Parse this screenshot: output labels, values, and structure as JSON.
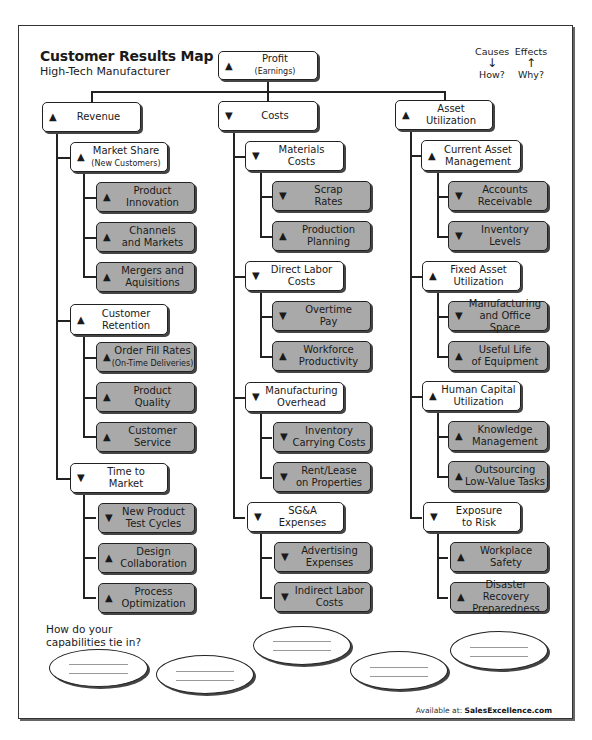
{
  "header": {
    "title": "Customer Results Map",
    "subtitle": "High-Tech Manufacturer"
  },
  "legend": {
    "causes": {
      "label": "Causes",
      "arrow": "↓",
      "question": "How?"
    },
    "effects": {
      "label": "Effects",
      "arrow": "↑",
      "question": "Why?"
    }
  },
  "symbols": {
    "up": "▲",
    "down": "▼"
  },
  "root": {
    "label": "Profit",
    "sublabel": "(Earnings)",
    "direction": "▲"
  },
  "columns": [
    {
      "label": "Revenue",
      "direction": "▲",
      "groups": [
        {
          "label": "Market Share",
          "sublabel": "(New Customers)",
          "direction": "▲",
          "items": [
            {
              "label": "Product",
              "label2": "Innovation",
              "direction": "▲"
            },
            {
              "label": "Channels",
              "label2": "and Markets",
              "direction": "▲"
            },
            {
              "label": "Mergers and",
              "label2": "Aquisitions",
              "direction": "▲"
            }
          ]
        },
        {
          "label": "Customer",
          "sublabel": "Retention",
          "direction": "▲",
          "items": [
            {
              "label": "Order Fill Rates",
              "label2": "(On-Time Deliveries)",
              "direction": "▲"
            },
            {
              "label": "Product",
              "label2": "Quality",
              "direction": "▲"
            },
            {
              "label": "Customer",
              "label2": "Service",
              "direction": "▲"
            }
          ]
        },
        {
          "label": "Time to",
          "sublabel": "Market",
          "direction": "▼",
          "items": [
            {
              "label": "New Product",
              "label2": "Test Cycles",
              "direction": "▼"
            },
            {
              "label": "Design",
              "label2": "Collaboration",
              "direction": "▲"
            },
            {
              "label": "Process",
              "label2": "Optimization",
              "direction": "▲"
            }
          ]
        }
      ]
    },
    {
      "label": "Costs",
      "direction": "▼",
      "groups": [
        {
          "label": "Materials",
          "sublabel": "Costs",
          "direction": "▼",
          "items": [
            {
              "label": "Scrap",
              "label2": "Rates",
              "direction": "▼"
            },
            {
              "label": "Production",
              "label2": "Planning",
              "direction": "▲"
            }
          ]
        },
        {
          "label": "Direct Labor",
          "sublabel": "Costs",
          "direction": "▼",
          "items": [
            {
              "label": "Overtime",
              "label2": "Pay",
              "direction": "▼"
            },
            {
              "label": "Workforce",
              "label2": "Productivity",
              "direction": "▲"
            }
          ]
        },
        {
          "label": "Manufacturing",
          "sublabel": "Overhead",
          "direction": "▼",
          "items": [
            {
              "label": "Inventory",
              "label2": "Carrying Costs",
              "direction": "▼"
            },
            {
              "label": "Rent/Lease",
              "label2": "on Properties",
              "direction": "▼"
            }
          ]
        },
        {
          "label": "SG&A",
          "sublabel": "Expenses",
          "direction": "▼",
          "items": [
            {
              "label": "Advertising",
              "label2": "Expenses",
              "direction": "▼"
            },
            {
              "label": "Indirect Labor",
              "label2": "Costs",
              "direction": "▼"
            }
          ]
        }
      ]
    },
    {
      "label": "Asset",
      "label2": "Utilization",
      "direction": "▲",
      "groups": [
        {
          "label": "Current Asset",
          "sublabel": "Management",
          "direction": "▲",
          "items": [
            {
              "label": "Accounts",
              "label2": "Receivable",
              "direction": "▼"
            },
            {
              "label": "Inventory",
              "label2": "Levels",
              "direction": "▼"
            }
          ]
        },
        {
          "label": "Fixed Asset",
          "sublabel": "Utilization",
          "direction": "▲",
          "items": [
            {
              "label": "Manufacturing",
              "label2": "and Office Space",
              "direction": "▼"
            },
            {
              "label": "Useful Life",
              "label2": "of Equipment",
              "direction": "▲"
            }
          ]
        },
        {
          "label": "Human Capital",
          "sublabel": "Utilization",
          "direction": "▲",
          "items": [
            {
              "label": "Knowledge",
              "label2": "Management",
              "direction": "▲"
            },
            {
              "label": "Outsourcing",
              "label2": "Low-Value Tasks",
              "direction": "▲"
            }
          ]
        },
        {
          "label": "Exposure",
          "sublabel": "to Risk",
          "direction": "▼",
          "items": [
            {
              "label": "Workplace",
              "label2": "Safety",
              "direction": "▲"
            },
            {
              "label": "Disaster Recovery",
              "label2": "Preparedness",
              "direction": "▲"
            }
          ]
        }
      ]
    }
  ],
  "capabilities": {
    "question_line1": "How do your",
    "question_line2": "capabilities tie in?",
    "ovals": 5
  },
  "footer": {
    "prefix": "Available at: ",
    "site": "SalesExcellence.com"
  }
}
